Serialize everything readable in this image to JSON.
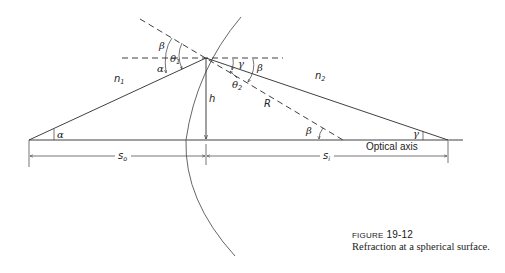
{
  "figure": {
    "number_prefix": "FIGURE",
    "number": "19-12",
    "caption": "Refraction at a spherical surface."
  },
  "labels": {
    "n1": "n",
    "n1_sub": "1",
    "n2": "n",
    "n2_sub": "2",
    "h": "h",
    "R": "R",
    "alpha_top": "α",
    "alpha_bottom": "α",
    "beta_top_left": "β",
    "beta_top_right": "β",
    "beta_bottom": "β",
    "gamma_top": "γ",
    "gamma_bottom": "γ",
    "theta1": "θ",
    "theta1_sub": "1",
    "theta2": "θ",
    "theta2_sub": "2",
    "s_o": "s",
    "s_o_sub": "o",
    "s_i": "s",
    "s_i_sub": "i",
    "optical_axis": "Optical axis"
  },
  "geometry": {
    "object_point": [
      29,
      140
    ],
    "incidence_point": [
      206,
      58
    ],
    "vertex_foot": [
      206,
      140
    ],
    "center_of_curvature": [
      343,
      140
    ],
    "image_point": [
      448,
      140
    ]
  }
}
